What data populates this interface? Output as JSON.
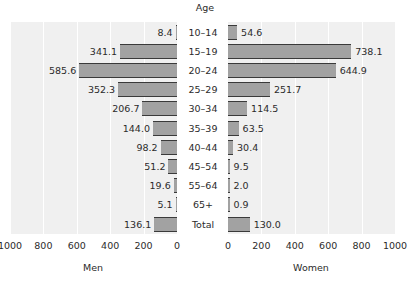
{
  "chart_data": {
    "type": "bar",
    "subtype": "population-pyramid",
    "title": "",
    "age_header": "Age",
    "categories": [
      "10–14",
      "15–19",
      "20–24",
      "25–29",
      "30–34",
      "35–39",
      "40–44",
      "45–54",
      "55–64",
      "65+",
      "Total"
    ],
    "series": [
      {
        "name": "Men",
        "side": "left",
        "values": [
          8.4,
          341.1,
          585.6,
          352.3,
          206.7,
          144.0,
          98.2,
          51.2,
          19.6,
          5.1,
          136.1
        ],
        "labels": [
          "8.4",
          "341.1",
          "585.6",
          "352.3",
          "206.7",
          "144.0",
          "98.2",
          "51.2",
          "19.6",
          "5.1",
          "136.1"
        ]
      },
      {
        "name": "Women",
        "side": "right",
        "values": [
          54.6,
          738.1,
          644.9,
          251.7,
          114.5,
          63.5,
          30.4,
          9.5,
          2.0,
          0.9,
          130.0
        ],
        "labels": [
          "54.6",
          "738.1",
          "644.9",
          "251.7",
          "114.5",
          "63.5",
          "30.4",
          "9.5",
          "2.0",
          "0.9",
          "130.0"
        ]
      }
    ],
    "xlabel_left": "Men",
    "xlabel_right": "Women",
    "ylabel": "Age",
    "xlim": [
      0,
      1000
    ],
    "ticks": [
      0,
      200,
      400,
      600,
      800,
      1000
    ],
    "tick_labels_left": [
      "1000",
      "800",
      "600",
      "400",
      "200",
      "0"
    ],
    "tick_labels_right": [
      "0",
      "200",
      "400",
      "600",
      "800",
      "1000"
    ],
    "grid": true,
    "legend": "none",
    "colors": {
      "bar_fill": "#a2a2a2",
      "bar_edge": "#3a3a3a",
      "panel_background": "#f0f0f0",
      "gridline": "#ffffff",
      "text": "#2b2b2b",
      "page_background": "#ffffff"
    }
  }
}
